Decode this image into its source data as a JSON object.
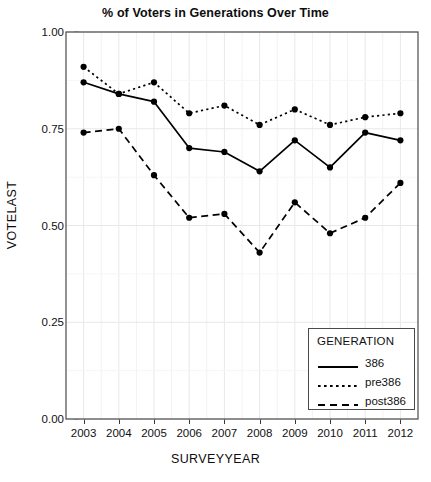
{
  "chart_data": {
    "type": "line",
    "title": "% of Voters in Generations Over Time",
    "xlabel": "SURVEYYEAR",
    "ylabel": "VOTELAST",
    "x": [
      2003,
      2004,
      2005,
      2006,
      2007,
      2008,
      2009,
      2010,
      2011,
      2012
    ],
    "categories": [
      "2003",
      "2004",
      "2005",
      "2006",
      "2007",
      "2008",
      "2009",
      "2010",
      "2011",
      "2012"
    ],
    "xtick_labels": [
      "2003",
      "2004",
      "2005",
      "2006",
      "2007",
      "2008",
      "2009",
      "2010",
      "2011",
      "2012"
    ],
    "ytick_labels": [
      "0.00",
      "0.25",
      "0.50",
      "0.75",
      "1.00"
    ],
    "yticks": [
      0.0,
      0.25,
      0.5,
      0.75,
      1.0
    ],
    "ylim": [
      0.0,
      1.0
    ],
    "xlim": [
      2002.5,
      2012.5
    ],
    "grid": true,
    "legend_position": "lower right",
    "legend_title": "GENERATION",
    "series": [
      {
        "name": "386",
        "style": "solid",
        "color": "#000000",
        "values": [
          0.87,
          0.84,
          0.82,
          0.7,
          0.69,
          0.64,
          0.72,
          0.65,
          0.74,
          0.72
        ]
      },
      {
        "name": "pre386",
        "style": "dotted",
        "color": "#000000",
        "values": [
          0.91,
          0.84,
          0.87,
          0.79,
          0.81,
          0.76,
          0.8,
          0.76,
          0.78,
          0.79
        ]
      },
      {
        "name": "post386",
        "style": "dashed",
        "color": "#000000",
        "values": [
          0.74,
          0.75,
          0.63,
          0.52,
          0.53,
          0.43,
          0.56,
          0.48,
          0.52,
          0.61
        ]
      }
    ]
  },
  "legend": {
    "title": "GENERATION",
    "entries": [
      {
        "label": "386",
        "style": "solid"
      },
      {
        "label": "pre386",
        "style": "dotted"
      },
      {
        "label": "post386",
        "style": "dashed"
      }
    ]
  },
  "colors": {
    "line": "#000000",
    "axis": "#4a4a4a",
    "grid": "#e8e8e8",
    "text": "#111111",
    "background": "#ffffff"
  }
}
